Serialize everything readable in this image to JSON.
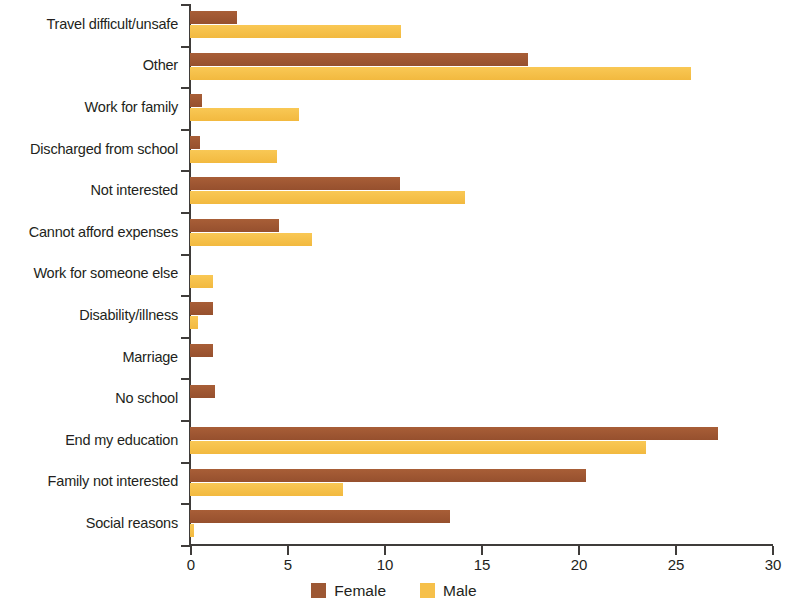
{
  "chart_data": {
    "type": "bar",
    "orientation": "horizontal",
    "title": "",
    "subtitle": "",
    "xlabel": "",
    "ylabel": "",
    "xlim": [
      0,
      30
    ],
    "xticks": [
      0,
      5,
      10,
      15,
      20,
      25,
      30
    ],
    "xtick_labels": [
      "0",
      "5",
      "10",
      "15",
      "20",
      "25",
      "30"
    ],
    "grid": false,
    "legend_position": "bottom-center",
    "categories": [
      "Travel difficult/unsafe",
      "Other",
      "Work for family",
      "Discharged from school",
      "Not interested",
      "Cannot afford expenses",
      "Work for someone else",
      "Disability/illness",
      "Marriage",
      "No school",
      "End my education",
      "Family not interested",
      "Social reasons"
    ],
    "series": [
      {
        "name": "Female",
        "color": "#9d5834",
        "values": [
          2.4,
          17.4,
          0.6,
          0.5,
          10.8,
          4.6,
          0.0,
          1.2,
          1.2,
          1.3,
          27.2,
          20.4,
          13.4
        ]
      },
      {
        "name": "Male",
        "color": "#f6c04a",
        "values": [
          10.9,
          25.8,
          5.6,
          4.5,
          14.2,
          6.3,
          1.2,
          0.4,
          0.0,
          0.0,
          23.5,
          7.9,
          0.2
        ]
      }
    ]
  },
  "legend": {
    "entries": [
      {
        "label": "Female",
        "swatch": "female-swatch"
      },
      {
        "label": "Male",
        "swatch": "male-swatch"
      }
    ]
  }
}
